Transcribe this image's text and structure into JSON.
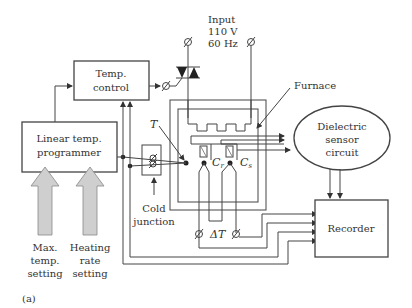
{
  "figure_label": "(a)",
  "blocks": {
    "temp_control": {
      "line1": "Temp.",
      "line2": "control"
    },
    "programmer": {
      "line1": "Linear temp.",
      "line2": "programmer"
    },
    "sensor": {
      "line1": "Dielectric",
      "line2": "sensor",
      "line3": "circuit"
    },
    "recorder": {
      "label": "Recorder"
    }
  },
  "labels": {
    "input1": "Input",
    "input2": "110 V",
    "input3": "60 Hz",
    "furnace": "Furnace",
    "T": "T",
    "cr": "C",
    "cr_sub": "r",
    "cs": "C",
    "cs_sub": "s",
    "delta_t": "ΔT",
    "cold1": "Cold",
    "cold2": "junction",
    "max1": "Max.",
    "max2": "temp.",
    "max3": "setting",
    "heat1": "Heating",
    "heat2": "rate",
    "heat3": "setting"
  },
  "colors": {
    "line": "#444444",
    "arrow_fill": "#cfcfcf",
    "text": "#333333"
  }
}
